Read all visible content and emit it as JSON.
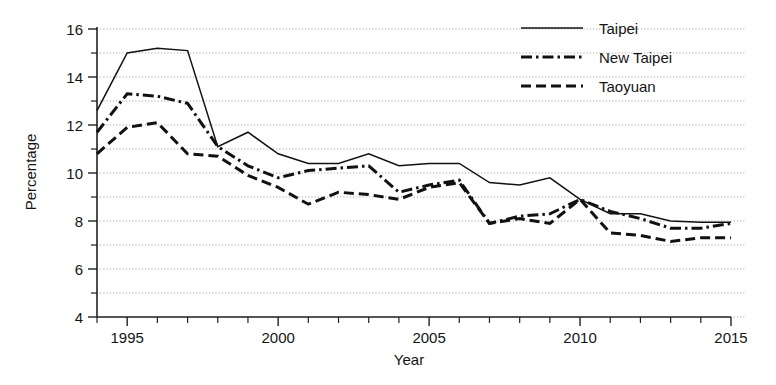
{
  "chart_data": {
    "type": "line",
    "title": "",
    "xlabel": "Year",
    "ylabel": "Percentage",
    "xlim": [
      1994,
      2015
    ],
    "ylim": [
      4,
      16
    ],
    "ytick_step": 2,
    "yticks": [
      4,
      6,
      8,
      10,
      12,
      14,
      16
    ],
    "ytick_labels": [
      "4",
      "6",
      "8",
      "10",
      "12",
      "14",
      "16"
    ],
    "minor_yticks": [
      5,
      7,
      9,
      11,
      13,
      15
    ],
    "xticks": [
      1995,
      2000,
      2005,
      2010,
      2015
    ],
    "xtick_labels": [
      "1995",
      "2000",
      "2005",
      "2010",
      "2015"
    ],
    "x": [
      1994,
      1995,
      1996,
      1997,
      1998,
      1999,
      2000,
      2001,
      2002,
      2003,
      2004,
      2005,
      2006,
      2007,
      2008,
      2009,
      2010,
      2011,
      2012,
      2013,
      2014,
      2015
    ],
    "grid": "horizontal-dotted",
    "legend_position": "top-right",
    "series": [
      {
        "name": "Taipei",
        "style": "solid",
        "color": "#111111",
        "values": [
          12.6,
          15.0,
          15.2,
          15.1,
          11.1,
          11.7,
          10.8,
          10.4,
          10.4,
          10.8,
          10.3,
          10.4,
          10.4,
          9.6,
          9.5,
          9.8,
          8.9,
          8.3,
          8.3,
          8.0,
          7.95,
          7.95
        ]
      },
      {
        "name": "New Taipei",
        "style": "dash-dot",
        "color": "#111111",
        "values": [
          11.7,
          13.3,
          13.2,
          12.9,
          11.1,
          10.3,
          9.8,
          10.1,
          10.2,
          10.3,
          9.2,
          9.5,
          9.7,
          7.9,
          8.2,
          8.3,
          8.9,
          8.4,
          8.1,
          7.7,
          7.7,
          7.9
        ]
      },
      {
        "name": "Taoyuan",
        "style": "dashed",
        "color": "#111111",
        "values": [
          10.8,
          11.9,
          12.1,
          10.8,
          10.7,
          9.9,
          9.4,
          8.7,
          9.2,
          9.1,
          8.9,
          9.4,
          9.6,
          7.9,
          8.1,
          7.9,
          8.9,
          7.5,
          7.4,
          7.15,
          7.3,
          7.3
        ]
      }
    ]
  },
  "legend": {
    "items": [
      {
        "label": "Taipei",
        "style": "solid"
      },
      {
        "label": "New Taipei",
        "style": "dash-dot"
      },
      {
        "label": "Taoyuan",
        "style": "dashed"
      }
    ]
  },
  "axes": {
    "x_title": "Year",
    "y_title": "Percentage"
  }
}
